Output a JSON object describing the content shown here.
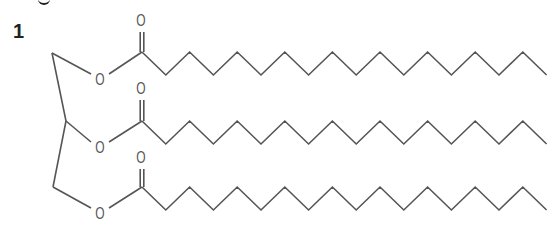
{
  "figure": {
    "compound_number": "1",
    "line_color": "#555555",
    "label_color": "#222222",
    "glycerol_backbone": {
      "carbons": [
        [
          52,
          53
        ],
        [
          66,
          121
        ],
        [
          53,
          187
        ]
      ]
    },
    "ester_groups": [
      {
        "ester_oxygen_label": "O",
        "carbonyl_oxygen_label": "O",
        "ester_o_pos": [
          100,
          79
        ],
        "carbonyl_o_pos": [
          141,
          20
        ],
        "carbonyl_c": [
          142,
          52
        ],
        "chain_carbons": 18
      },
      {
        "ester_oxygen_label": "O",
        "carbonyl_oxygen_label": "O",
        "ester_o_pos": [
          100,
          147
        ],
        "carbonyl_o_pos": [
          141,
          88
        ],
        "carbonyl_c": [
          142,
          121
        ],
        "chain_carbons": 18
      },
      {
        "ester_oxygen_label": "O",
        "carbonyl_oxygen_label": "O",
        "ester_o_pos": [
          100,
          213
        ],
        "carbonyl_o_pos": [
          141,
          157
        ],
        "carbonyl_c": [
          142,
          187
        ],
        "chain_carbons": 18
      }
    ]
  }
}
